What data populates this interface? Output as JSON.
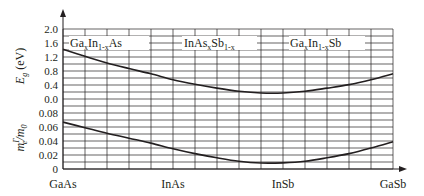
{
  "chart_data": [
    {
      "type": "line",
      "title": "",
      "ylabel": "E_g (eV)",
      "xlabel": "",
      "x_categories": [
        "GaAs",
        "InAs",
        "InSb",
        "GaSb"
      ],
      "yticks": [
        "2.0",
        "1.6",
        "1.2",
        "0.8",
        "0.4",
        "0.0"
      ],
      "ylim": [
        0.0,
        2.0
      ],
      "grid": true,
      "annotations": [
        {
          "text": "Ga",
          "sub": "x",
          "text2": "In",
          "sub2": "1-x",
          "text3": "As",
          "region": "GaAs-InAs"
        },
        {
          "text": "InAs",
          "sub": "x",
          "text2": "Sb",
          "sub2": "1-x",
          "text3": "",
          "region": "InAs-InSb"
        },
        {
          "text": "Ga",
          "sub": "x",
          "text2": "In",
          "sub2": "1-x",
          "text3": "Sb",
          "region": "InSb-GaSb"
        }
      ],
      "series": [
        {
          "name": "Band gap",
          "x": [
            0,
            1,
            2,
            3,
            4,
            5,
            6,
            7,
            8,
            9,
            10,
            11,
            12,
            13,
            14,
            15
          ],
          "values": [
            1.42,
            1.22,
            1.03,
            0.87,
            0.72,
            0.55,
            0.42,
            0.31,
            0.22,
            0.17,
            0.17,
            0.22,
            0.31,
            0.41,
            0.55,
            0.72
          ]
        }
      ]
    },
    {
      "type": "line",
      "title": "",
      "ylabel": "m_e^Γ / m_0",
      "xlabel": "",
      "x_categories": [
        "GaAs",
        "InAs",
        "InSb",
        "GaSb"
      ],
      "yticks": [
        "0.08",
        "0.06",
        "0.04",
        "0.02",
        "0"
      ],
      "ylim": [
        0,
        0.08
      ],
      "grid": true,
      "series": [
        {
          "name": "Electron effective mass",
          "x": [
            0,
            1,
            2,
            3,
            4,
            5,
            6,
            7,
            8,
            9,
            10,
            11,
            12,
            13,
            14,
            15
          ],
          "values": [
            0.067,
            0.059,
            0.051,
            0.044,
            0.037,
            0.029,
            0.022,
            0.016,
            0.011,
            0.0085,
            0.0088,
            0.011,
            0.016,
            0.022,
            0.03,
            0.039
          ]
        }
      ]
    }
  ],
  "labels": {
    "eg_axis_main": "E",
    "eg_axis_sub": "g",
    "eg_axis_unit": " (eV)",
    "mass_axis_main": "m",
    "mass_axis_sup": "Γ",
    "mass_axis_sub": "e",
    "mass_axis_rest": "/m",
    "mass_axis_sub2": "0",
    "ann1_a": "Ga",
    "ann1_b": "x",
    "ann1_c": "In",
    "ann1_d": "1-x",
    "ann1_e": "As",
    "ann2_a": "InAs",
    "ann2_b": "x",
    "ann2_c": "Sb",
    "ann2_d": "1-x",
    "ann3_a": "Ga",
    "ann3_b": "x",
    "ann3_c": "In",
    "ann3_d": "1-x",
    "ann3_e": "Sb",
    "x_gaas": "GaAs",
    "x_inas": "InAs",
    "x_insb": "InSb",
    "x_gasb": "GaSb",
    "yt_20": "2.0",
    "yt_16": "1.6",
    "yt_12": "1.2",
    "yt_08": "0.8",
    "yt_04": "0.4",
    "yt_00": "0.0",
    "yt_m08": "0.08",
    "yt_m06": "0.06",
    "yt_m04": "0.04",
    "yt_m02": "0.02",
    "yt_m0": "0"
  }
}
